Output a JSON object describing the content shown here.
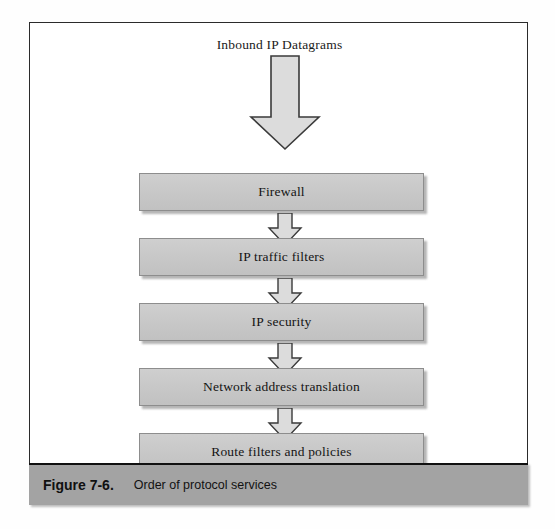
{
  "figure": {
    "source_label": "Inbound IP Datagrams",
    "caption_number": "Figure 7-6.",
    "caption_title": "Order of protocol services",
    "colors": {
      "box_fill": "#c7c7c7",
      "box_border": "#8d8d8d",
      "arrow_fill": "#dcdcdc",
      "arrow_border": "#3a3a3a",
      "caption_bar": "#a3a3a3",
      "frame_border": "#2b2b2b",
      "text": "#141414"
    },
    "stages": [
      {
        "label": "Firewall"
      },
      {
        "label": "IP traffic filters"
      },
      {
        "label": "IP security"
      },
      {
        "label": "Network address translation"
      },
      {
        "label": "Route filters and policies"
      }
    ],
    "icons": {
      "inbound_arrow": "down-block-arrow-large",
      "connector_arrow": "down-block-arrow-small"
    }
  }
}
